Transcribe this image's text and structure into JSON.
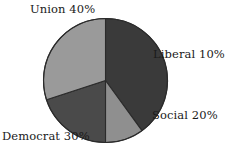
{
  "chart_data": {
    "type": "pie",
    "title": "",
    "categories": [
      "Union",
      "Liberal",
      "Social",
      "Democrat"
    ],
    "values": [
      40,
      20,
      10,
      30
    ],
    "unit": "%",
    "legend": "none",
    "labels_inline": true,
    "slices": [
      {
        "name": "Union",
        "value": 40,
        "label": "Union 40%",
        "color": "#3a3a3a",
        "start_angle": 0,
        "end_angle": 144
      },
      {
        "name": "Liberal",
        "value": 10,
        "label": "Liberal 10%",
        "color": "#8f8f8f",
        "start_angle": 144,
        "end_angle": 180
      },
      {
        "name": "Social",
        "value": 20,
        "label": "Social 20%",
        "color": "#4a4a4a",
        "start_angle": 180,
        "end_angle": 252
      },
      {
        "name": "Democrat",
        "value": 30,
        "label": "Democrat 30%",
        "color": "#9a9a9a",
        "start_angle": 252,
        "end_angle": 360
      }
    ],
    "geometry": {
      "center_x": 105.5,
      "center_y": 80.5,
      "radius": 62
    },
    "colors": {
      "background": "#ffffff",
      "outline": "#2b2b2b",
      "text": "#1a1a1a"
    }
  }
}
